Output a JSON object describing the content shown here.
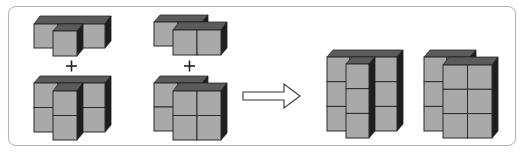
{
  "diagram": {
    "type": "cube-puzzle",
    "colors": {
      "front_face": "#a9a9a9",
      "top_face": "#5b5b5b",
      "side_face": "#1e1e1e",
      "edge": "#2a2a2a",
      "frame_border": "#b4b4b4",
      "background": "#ffffff"
    },
    "operators": {
      "plus_1": "+",
      "plus_2": "+",
      "arrow": "right-arrow"
    },
    "groups": [
      {
        "name": "pair-1",
        "top_piece": {
          "back_row_cubes": 3,
          "front_row_cubes": 1,
          "height": 1
        },
        "bottom_piece": {
          "back_row_cubes": 3,
          "front_row_cubes": 1,
          "height": 2
        }
      },
      {
        "name": "pair-2",
        "top_piece": {
          "back_row_cubes": 2,
          "front_row_cubes": 2,
          "height": 1
        },
        "bottom_piece": {
          "back_row_cubes": 2,
          "front_row_cubes": 2,
          "height": 2
        }
      }
    ],
    "results": [
      {
        "name": "result-1",
        "back_row_cubes": 3,
        "front_row_cubes": 1,
        "height": 3
      },
      {
        "name": "result-2",
        "back_row_cubes": 2,
        "front_row_cubes": 2,
        "height": 3
      }
    ]
  }
}
